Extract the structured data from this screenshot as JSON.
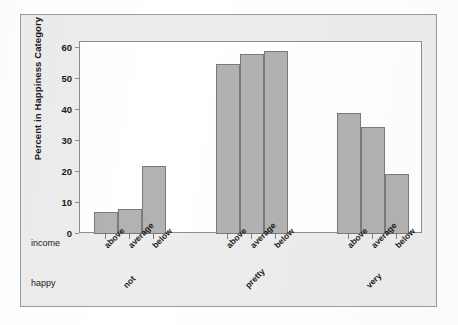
{
  "chart_data": {
    "type": "bar",
    "title": "",
    "xlabel": "",
    "ylabel": "Percent in Happiness Category",
    "ylim": [
      0,
      62
    ],
    "yticks": [
      0,
      10,
      20,
      30,
      40,
      50,
      60
    ],
    "grid": false,
    "legend": null,
    "row_headers": {
      "category_row": "income",
      "group_row": "happy"
    },
    "categories": [
      "above",
      "average",
      "below"
    ],
    "groups": [
      {
        "label": "not",
        "bars": [
          {
            "category": "above",
            "value": 7
          },
          {
            "category": "average",
            "value": 8
          },
          {
            "category": "below",
            "value": 22
          }
        ]
      },
      {
        "label": "pretty",
        "bars": [
          {
            "category": "above",
            "value": 55
          },
          {
            "category": "average",
            "value": 58
          },
          {
            "category": "below",
            "value": 59
          }
        ]
      },
      {
        "label": "very",
        "bars": [
          {
            "category": "above",
            "value": 39
          },
          {
            "category": "average",
            "value": 34.5
          },
          {
            "category": "below",
            "value": 19.5
          }
        ]
      }
    ],
    "colors": {
      "bar_fill": "#b2b2b2",
      "bar_stroke": "#7a7a7a",
      "plot_background": "#ffffff",
      "figure_background": "#ededed",
      "axis": "#8d8d8d",
      "text": "#1a1a1a"
    }
  }
}
